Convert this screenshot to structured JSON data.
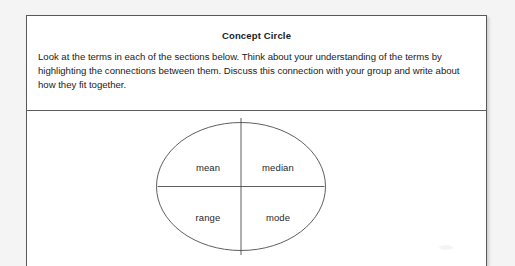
{
  "page": {
    "background_color": "#f4f4f4",
    "sheet_color": "#ffffff",
    "ink_color": "#1b1b1b",
    "rule_color": "#5d5d5d"
  },
  "header": {
    "title": "Concept Circle",
    "instructions": "Look at the terms in each of the sections below. Think about your understanding of the terms by highlighting the connections between them. Discuss this connection with your group and write about how they fit together."
  },
  "concept_circle": {
    "shape": "ellipse",
    "divider_count": 2,
    "quadrants": [
      {
        "position": "top-left",
        "term": "mean"
      },
      {
        "position": "top-right",
        "term": "median"
      },
      {
        "position": "bottom-left",
        "term": "range"
      },
      {
        "position": "bottom-right",
        "term": "mode"
      }
    ]
  }
}
